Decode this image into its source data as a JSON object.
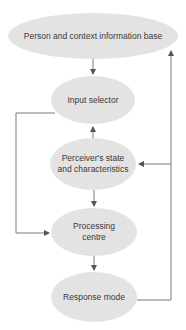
{
  "diagram": {
    "colors": {
      "node_fill": "#e3e3e3",
      "line": "#7a7a7a",
      "text": "#3a3a3a"
    },
    "nodes": [
      {
        "id": "person_context",
        "label": "Person and context information base"
      },
      {
        "id": "input_selector",
        "label": "Input selector"
      },
      {
        "id": "perceiver",
        "label": "Perceiver's state and characteristics"
      },
      {
        "id": "processing",
        "label": "Processing centre"
      },
      {
        "id": "response",
        "label": "Response mode"
      }
    ],
    "edges": [
      {
        "from": "person_context",
        "to": "input_selector"
      },
      {
        "from": "perceiver",
        "to": "input_selector"
      },
      {
        "from": "perceiver",
        "to": "processing"
      },
      {
        "from": "input_selector",
        "to": "processing",
        "route": "left loop"
      },
      {
        "from": "processing",
        "to": "response"
      },
      {
        "from": "response",
        "to": "person_context",
        "route": "right loop"
      },
      {
        "from": "response",
        "to": "perceiver",
        "route": "right loop branch"
      }
    ]
  }
}
